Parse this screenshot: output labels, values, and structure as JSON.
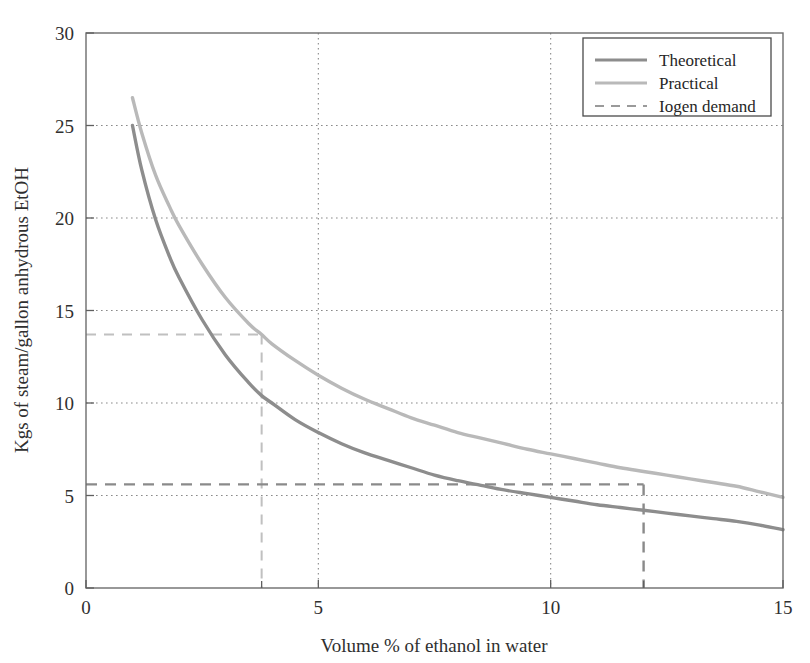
{
  "chart_data": {
    "type": "line",
    "title": "",
    "xlabel": "Volume % of ethanol in water",
    "ylabel": "Kgs of steam/gallon anhydrous EtOH",
    "xlim": [
      0,
      15
    ],
    "ylim": [
      0,
      30
    ],
    "xticks": [
      0,
      5,
      10,
      15
    ],
    "xtick_labels": [
      "0",
      "5",
      "10",
      "15"
    ],
    "yticks": [
      0,
      5,
      10,
      15,
      20,
      25,
      30
    ],
    "ytick_labels": [
      "0",
      "5",
      "10",
      "15",
      "20",
      "25",
      "30"
    ],
    "grid": true,
    "grid_style": "dotted",
    "legend_position": "top-right",
    "series": [
      {
        "name": "Theoretical",
        "color": "#8d8d8d",
        "style": "solid",
        "x": [
          1.0,
          1.2,
          1.5,
          1.8,
          2.0,
          2.5,
          3.0,
          3.5,
          3.78,
          4.0,
          4.5,
          5.0,
          5.5,
          6.0,
          6.5,
          7.0,
          7.5,
          8.0,
          8.5,
          9.0,
          9.5,
          10.0,
          10.5,
          11.0,
          11.5,
          12.0,
          12.5,
          13.0,
          13.5,
          14.0,
          14.5,
          15.0
        ],
        "values": [
          25.0,
          22.6,
          19.9,
          17.9,
          16.8,
          14.5,
          12.6,
          11.1,
          10.4,
          10.0,
          9.1,
          8.4,
          7.8,
          7.3,
          6.9,
          6.5,
          6.1,
          5.8,
          5.55,
          5.3,
          5.1,
          4.9,
          4.7,
          4.5,
          4.35,
          4.2,
          4.05,
          3.9,
          3.75,
          3.6,
          3.4,
          3.15
        ]
      },
      {
        "name": "Practical",
        "color": "#b9b9b9",
        "style": "solid",
        "x": [
          1.0,
          1.2,
          1.5,
          1.8,
          2.0,
          2.5,
          3.0,
          3.5,
          3.78,
          4.0,
          4.5,
          5.0,
          5.5,
          6.0,
          6.5,
          7.0,
          7.5,
          8.0,
          8.5,
          9.0,
          9.5,
          10.0,
          10.5,
          11.0,
          11.5,
          12.0,
          12.5,
          13.0,
          13.5,
          14.0,
          14.5,
          15.0
        ],
        "values": [
          26.5,
          24.6,
          22.3,
          20.6,
          19.6,
          17.5,
          15.7,
          14.3,
          13.7,
          13.2,
          12.3,
          11.5,
          10.8,
          10.2,
          9.7,
          9.2,
          8.8,
          8.4,
          8.1,
          7.8,
          7.5,
          7.25,
          7.0,
          6.75,
          6.5,
          6.3,
          6.1,
          5.9,
          5.7,
          5.5,
          5.2,
          4.9
        ]
      }
    ],
    "reference_lines": [
      {
        "name": "Iogen demand",
        "label": "Iogen demand",
        "style": "dashed",
        "color": "#c0c0c0",
        "y": 13.7,
        "x": 3.78,
        "description": "horizontal from x=0 to x=3.78 at y=13.7, vertical from y=13.7 down to y=0"
      },
      {
        "name": "Iogen demand",
        "label": "Iogen demand",
        "style": "dashed",
        "color": "#8a8a8a",
        "y": 5.6,
        "x": 12.0,
        "description": "horizontal from x=0 to x=12 at y=5.6, vertical from y=5.6 down to y=0"
      }
    ],
    "legend": [
      {
        "label": "Theoretical",
        "color": "#8d8d8d",
        "style": "solid"
      },
      {
        "label": "Practical",
        "color": "#b9b9b9",
        "style": "solid"
      },
      {
        "label": "Iogen demand",
        "color": "#9a9a9a",
        "style": "dashed"
      }
    ]
  }
}
